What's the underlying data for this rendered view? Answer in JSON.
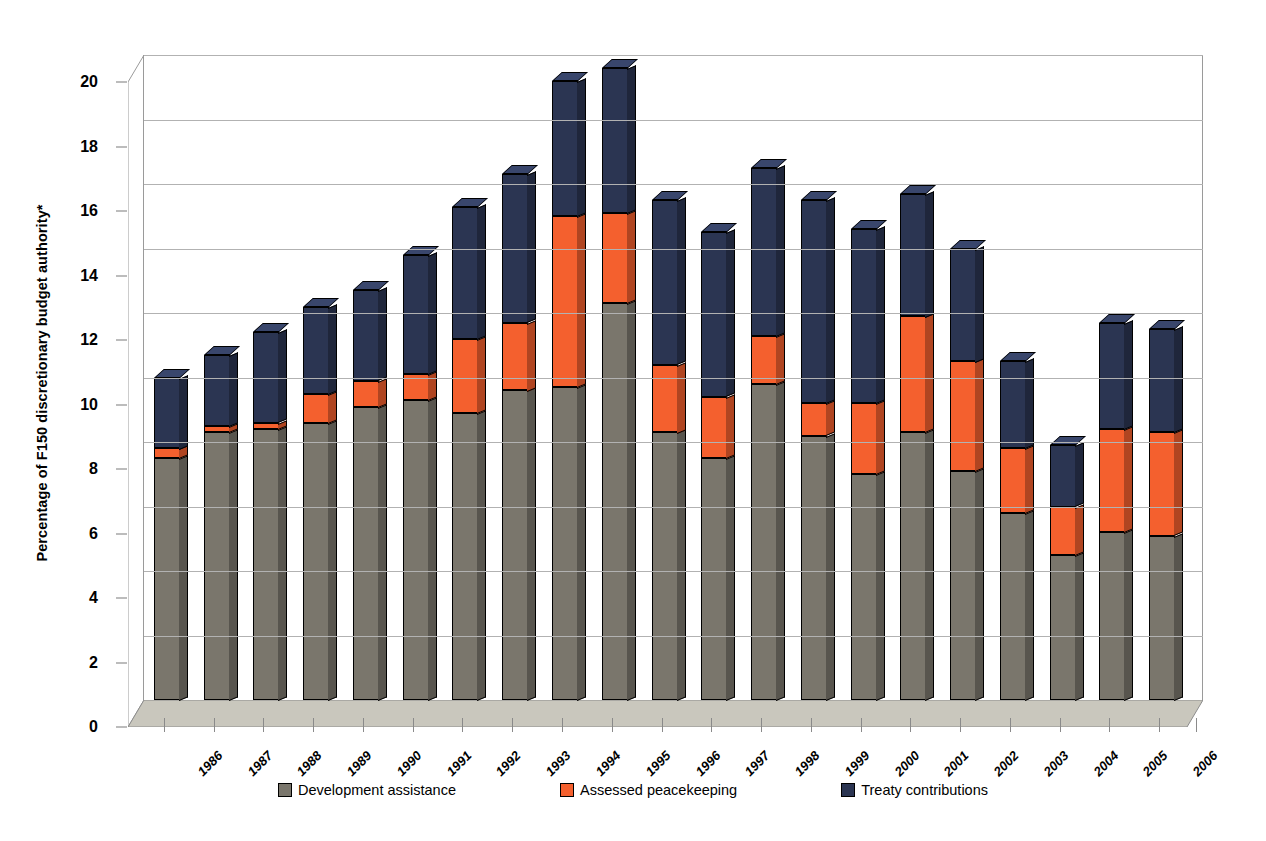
{
  "figure": {
    "title_remnant": "",
    "ylabel": "Percentage of F150 discretionary budget authority*",
    "xlabel": ""
  },
  "legend": {
    "items": [
      {
        "label": "Development assistance",
        "color": "#7a766c"
      },
      {
        "label": "Assessed peacekeeping",
        "color": "#f4602e"
      },
      {
        "label": "Treaty contributions",
        "color": "#2b3552"
      }
    ]
  },
  "axis": {
    "yticks": [
      "0",
      "2",
      "4",
      "6",
      "8",
      "10",
      "12",
      "14",
      "16",
      "18",
      "20"
    ],
    "ymin": 0,
    "ymax": 20
  },
  "chart_data": {
    "type": "bar",
    "stacked": true,
    "title": "Percentage of F150 discretionary budget authority*",
    "xlabel": "",
    "ylabel": "Percentage of F150 discretionary budget authority*",
    "ylim": [
      0,
      20
    ],
    "ytick_step": 2,
    "grid": true,
    "legend_position": "bottom",
    "categories": [
      "1986",
      "1987",
      "1988",
      "1989",
      "1990",
      "1991",
      "1992",
      "1993",
      "1994",
      "1995",
      "1996",
      "1997",
      "1998",
      "1999",
      "2000",
      "2001",
      "2002",
      "2003",
      "2004",
      "2005",
      "2006"
    ],
    "series": [
      {
        "name": "Development assistance",
        "color": "#7a766c",
        "values": [
          7.5,
          8.3,
          8.4,
          8.6,
          9.1,
          9.3,
          8.9,
          9.6,
          9.7,
          12.3,
          8.3,
          7.5,
          9.8,
          8.2,
          7.0,
          8.3,
          7.1,
          5.8,
          4.5,
          5.2,
          5.1
        ]
      },
      {
        "name": "Assessed peacekeeping",
        "color": "#f4602e",
        "values": [
          0.3,
          0.2,
          0.2,
          0.9,
          0.8,
          0.8,
          2.3,
          2.1,
          5.3,
          2.8,
          2.1,
          1.9,
          1.5,
          1.0,
          2.2,
          3.6,
          3.4,
          2.0,
          1.5,
          3.2,
          3.2
        ]
      },
      {
        "name": "Treaty contributions",
        "color": "#2b3552",
        "values": [
          2.2,
          2.2,
          2.8,
          2.7,
          2.8,
          3.7,
          4.1,
          4.6,
          4.2,
          4.5,
          5.1,
          5.1,
          5.2,
          6.3,
          5.4,
          3.8,
          3.5,
          2.7,
          1.9,
          3.3,
          3.2
        ]
      }
    ],
    "totals": [
      10.0,
      10.7,
      11.4,
      12.2,
      12.7,
      13.8,
      15.3,
      16.3,
      19.2,
      19.6,
      15.5,
      14.5,
      16.5,
      15.5,
      14.6,
      15.7,
      14.0,
      10.5,
      7.9,
      11.7,
      11.5
    ]
  }
}
